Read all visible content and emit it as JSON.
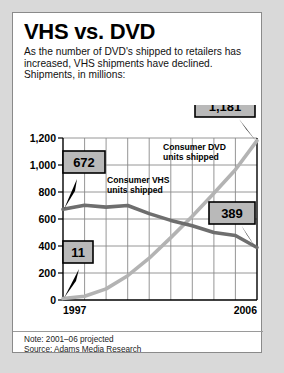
{
  "header": {
    "title": "VHS vs. DVD",
    "subtitle": "As the number of DVD's shipped to retailers has increased, VHS shipments have declined. Shipments, in millions:"
  },
  "footer": {
    "note": "Note: 2001–06 projected",
    "source": "Source: Adams Media Research"
  },
  "chart_data": {
    "type": "line",
    "title": "VHS vs. DVD",
    "xlabel": "",
    "ylabel": "Shipments, in millions",
    "x": [
      1997,
      1998,
      1999,
      2000,
      2001,
      2002,
      2003,
      2004,
      2005,
      2006
    ],
    "xtick_labels_shown": [
      "1997",
      "2006"
    ],
    "ytick_labels": [
      "0",
      "200",
      "400",
      "600",
      "800",
      "1,000",
      "1,200"
    ],
    "ytick_values": [
      0,
      200,
      400,
      600,
      800,
      1000,
      1200
    ],
    "ylim": [
      0,
      1200
    ],
    "grid": true,
    "legend_position": "inline-annotation",
    "series": [
      {
        "name": "Consumer VHS units shipped",
        "color": "#6e6e6e",
        "values": [
          672,
          702,
          688,
          700,
          640,
          590,
          550,
          500,
          478,
          389
        ]
      },
      {
        "name": "Consumer DVD units shipped",
        "color": "#b3b3b3",
        "values": [
          11,
          28,
          82,
          180,
          310,
          462,
          620,
          790,
          965,
          1181
        ]
      }
    ],
    "annotations": [
      {
        "label": "672",
        "series": "Consumer VHS units shipped",
        "x": 1997,
        "y": 672
      },
      {
        "label": "11",
        "series": "Consumer DVD units shipped",
        "x": 1997,
        "y": 11
      },
      {
        "label": "1,181",
        "series": "Consumer DVD units shipped",
        "x": 2006,
        "y": 1181
      },
      {
        "label": "389",
        "series": "Consumer VHS units shipped",
        "x": 2006,
        "y": 389
      }
    ],
    "series_labels": [
      {
        "text_line1": "Consumer VHS",
        "text_line2": "units shipped"
      },
      {
        "text_line1": "Consumer DVD",
        "text_line2": "units shipped"
      }
    ]
  },
  "colors": {
    "vhs_line": "#6e6e6e",
    "dvd_line": "#b3b3b3",
    "callout_fill": "#b9b9b9",
    "grid": "#808080",
    "page_background": "#d9d9d9",
    "card_background": "#ffffff"
  }
}
